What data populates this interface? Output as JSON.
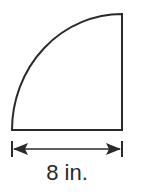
{
  "figure": {
    "shape": "quarter-circle",
    "stroke_color": "#2a2a2a",
    "dimension": {
      "label": "8 in.",
      "value": 8,
      "unit": "in.",
      "measures": "radius (bottom edge)"
    }
  }
}
